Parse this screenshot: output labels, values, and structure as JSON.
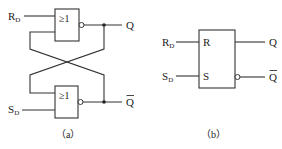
{
  "diagram_a": {
    "caption": "（a）",
    "upper_gate": {
      "symbol": "≥1"
    },
    "lower_gate": {
      "symbol": "≥1"
    },
    "inputs": {
      "reset": {
        "main": "R",
        "sub": "D"
      },
      "set": {
        "main": "S",
        "sub": "D"
      }
    },
    "outputs": {
      "q": "Q",
      "q_bar": "Q"
    }
  },
  "diagram_b": {
    "caption": "（b）",
    "box_pins": {
      "r": "R",
      "s": "S"
    },
    "inputs": {
      "reset": {
        "main": "R",
        "sub": "D"
      },
      "set": {
        "main": "S",
        "sub": "D"
      }
    },
    "outputs": {
      "q": "Q",
      "q_bar": "Q"
    }
  }
}
